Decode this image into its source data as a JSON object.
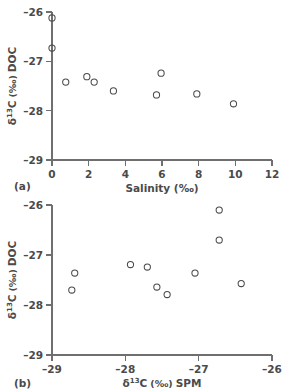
{
  "figure": {
    "background_color": "#ffffff",
    "marker_color": "#4a4a4a",
    "axis_color": "#6f6f6f"
  },
  "panels": [
    {
      "id": "a",
      "label": "(a)",
      "ylabel_parts": {
        "delta": "δ",
        "sup": "13",
        "element": "C",
        "units": "(‰)",
        "suffix": "DOC"
      },
      "xlabel": "Salinity (‰)",
      "ylabel": "δ 13C (‰) DOC",
      "xticks": [
        "0",
        "2",
        "4",
        "6",
        "8",
        "10",
        "12"
      ],
      "yticks": [
        "–26",
        "–27",
        "–28",
        "–29"
      ]
    },
    {
      "id": "b",
      "label": "(b)",
      "xlabel_parts": {
        "delta": "δ",
        "sup": "13",
        "element": "C",
        "units": "(‰)",
        "suffix": "SPM"
      },
      "ylabel_parts": {
        "delta": "δ",
        "sup": "13",
        "element": "C",
        "units": "(‰)",
        "suffix": "DOC"
      },
      "xlabel": "δ 13C (‰) SPM",
      "ylabel": "δ 13C (‰) DOC",
      "xticks": [
        "–29",
        "–28",
        "–27",
        "–26"
      ],
      "yticks": [
        "–26",
        "–27",
        "–28",
        "–29"
      ]
    }
  ],
  "chart_data": [
    {
      "type": "scatter",
      "panel": "a",
      "title": "",
      "xlabel": "Salinity (‰)",
      "ylabel": "δ13C (‰) DOC",
      "xlim": [
        0,
        12
      ],
      "ylim": [
        -29,
        -26
      ],
      "xticks": [
        0,
        2,
        4,
        6,
        8,
        10,
        12
      ],
      "yticks": [
        -26,
        -27,
        -28,
        -29
      ],
      "grid": false,
      "legend": "none",
      "marker": "open-circle",
      "points": [
        {
          "x": 0.0,
          "y": -26.12
        },
        {
          "x": 0.0,
          "y": -26.73
        },
        {
          "x": 0.75,
          "y": -27.42
        },
        {
          "x": 1.9,
          "y": -27.31
        },
        {
          "x": 2.3,
          "y": -27.42
        },
        {
          "x": 3.35,
          "y": -27.6
        },
        {
          "x": 5.95,
          "y": -27.24
        },
        {
          "x": 5.7,
          "y": -27.68
        },
        {
          "x": 7.9,
          "y": -27.66
        },
        {
          "x": 9.9,
          "y": -27.86
        }
      ]
    },
    {
      "type": "scatter",
      "panel": "b",
      "title": "",
      "xlabel": "δ13C (‰) SPM",
      "ylabel": "δ13C (‰) DOC",
      "xlim": [
        -29,
        -26
      ],
      "ylim": [
        -29,
        -26
      ],
      "xticks": [
        -29,
        -28,
        -27,
        -26
      ],
      "yticks": [
        -26,
        -27,
        -28,
        -29
      ],
      "grid": false,
      "legend": "none",
      "marker": "open-circle",
      "points": [
        {
          "x": -28.69,
          "y": -27.36
        },
        {
          "x": -28.73,
          "y": -27.7
        },
        {
          "x": -27.93,
          "y": -27.19
        },
        {
          "x": -27.7,
          "y": -27.24
        },
        {
          "x": -27.57,
          "y": -27.64
        },
        {
          "x": -27.43,
          "y": -27.79
        },
        {
          "x": -27.05,
          "y": -27.36
        },
        {
          "x": -26.72,
          "y": -26.1
        },
        {
          "x": -26.72,
          "y": -26.7
        },
        {
          "x": -26.42,
          "y": -27.57
        }
      ]
    }
  ]
}
